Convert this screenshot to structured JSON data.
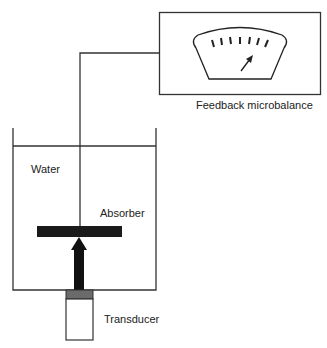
{
  "diagram": {
    "labels": {
      "balance": "Feedback microbalance",
      "water": "Water",
      "absorber": "Absorber",
      "transducer": "Transducer"
    },
    "colors": {
      "line": "#333333",
      "absorber": "#1a1a1a",
      "transducer_cap": "#6b6b6b"
    },
    "components": [
      "feedback-microbalance",
      "water-tank",
      "absorber",
      "acoustic-force-arrow",
      "transducer",
      "suspension-wire"
    ]
  }
}
